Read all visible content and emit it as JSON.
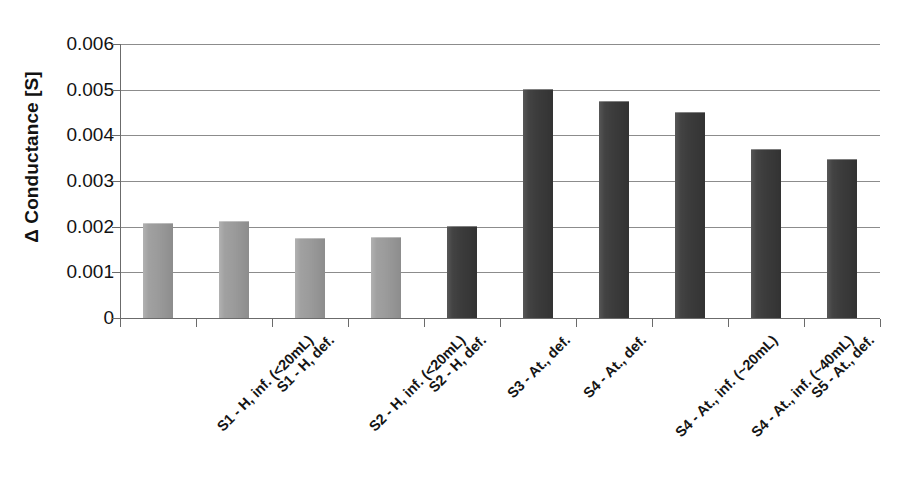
{
  "chart_data": {
    "type": "bar",
    "title": "",
    "xlabel": "",
    "ylabel": "Δ Conductance [S]",
    "ylim": [
      0,
      0.006
    ],
    "ytick_labels": [
      "0.006",
      "0.005",
      "0.004",
      "0.003",
      "0.002",
      "0.001",
      "0"
    ],
    "ytick_values": [
      0.006,
      0.005,
      0.004,
      0.003,
      0.002,
      0.001,
      0
    ],
    "grid": true,
    "legend": "none",
    "categories": [
      "S1 - H, inf. (<20mL)",
      "S1 - H, def.",
      "S2 - H, inf. (<20mL)",
      "S2 - H, def.",
      "S3 - At., def.",
      "S4 - At., def.",
      "S4 - At., inf. (~20mL)",
      "S4 - At., inf. (~40mL)",
      "S5 - At., def.",
      "S5 - At., inf. (~20mL)"
    ],
    "values": [
      0.00205,
      0.0021,
      0.00173,
      0.00175,
      0.002,
      0.005,
      0.00474,
      0.0045,
      0.00367,
      0.00345
    ],
    "bar_colors": [
      "#9c9c9c",
      "#9c9c9c",
      "#9c9c9c",
      "#9c9c9c",
      "#3c3c3c",
      "#3c3c3c",
      "#3c3c3c",
      "#3c3c3c",
      "#3c3c3c",
      "#3c3c3c"
    ],
    "color_light": "#9c9c9c",
    "color_dark": "#3c3c3c",
    "axis_color": "#6b6b6b",
    "gridline_color": "#8c8c8c"
  }
}
